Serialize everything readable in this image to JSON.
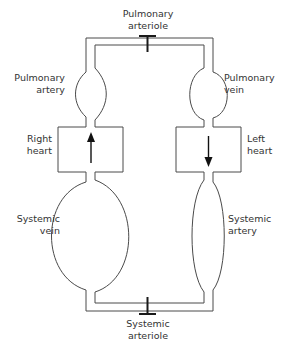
{
  "diagram": {
    "colors": {
      "background": "#ffffff",
      "vessel_stroke": "#4a4a4a",
      "valve_stroke": "#1a1a1a",
      "arrow_fill": "#111111",
      "label_text": "#333333"
    },
    "labels": {
      "pulmonary_arteriole": {
        "line1": "Pulmonary",
        "line2": "arteriole"
      },
      "pulmonary_artery": {
        "line1": "Pulmonary",
        "line2": "artery"
      },
      "pulmonary_vein": {
        "line1": "Pulmonary",
        "line2": "vein"
      },
      "right_heart": {
        "line1": "Right",
        "line2": "heart"
      },
      "left_heart": {
        "line1": "Left",
        "line2": "heart"
      },
      "systemic_vein": {
        "line1": "Systemic",
        "line2": "vein"
      },
      "systemic_artery": {
        "line1": "Systemic",
        "line2": "artery"
      },
      "systemic_arteriole": {
        "line1": "Systemic",
        "line2": "arteriole"
      }
    },
    "flow": {
      "right_heart_arrow": "up-arrow",
      "left_heart_arrow": "down-arrow"
    },
    "components": [
      "pulmonary-arteriole-valve",
      "pulmonary-artery-vessel",
      "pulmonary-vein-vessel",
      "right-heart-chamber",
      "left-heart-chamber",
      "systemic-vein-vessel",
      "systemic-artery-vessel",
      "systemic-arteriole-valve"
    ]
  }
}
